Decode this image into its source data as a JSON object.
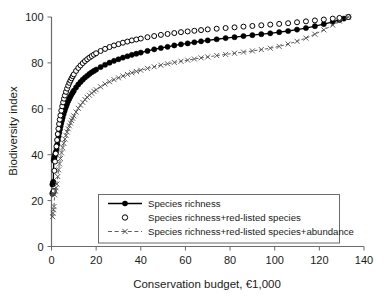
{
  "chart_data": {
    "type": "scatter",
    "title": "",
    "xlabel": "Conservation budget, €1,000",
    "ylabel": "Biodiversity index",
    "xlim": [
      0,
      140
    ],
    "ylim": [
      0,
      100
    ],
    "xticks": [
      0,
      20,
      40,
      60,
      80,
      100,
      120,
      140
    ],
    "yticks": [
      0,
      20,
      40,
      60,
      80,
      100
    ],
    "grid": false,
    "legend_position": "lower-center",
    "series": [
      {
        "name": "Species richness",
        "marker": "filled-circle",
        "line": "solid",
        "color": "#000000",
        "points": [
          [
            0.4,
            27.0
          ],
          [
            0.6,
            27.6
          ],
          [
            0.8,
            28.2
          ],
          [
            1.0,
            37.5
          ],
          [
            1.2,
            38.4
          ],
          [
            1.4,
            39.2
          ],
          [
            1.6,
            40.0
          ],
          [
            1.8,
            40.7
          ],
          [
            2.0,
            41.3
          ],
          [
            2.3,
            42.6
          ],
          [
            2.6,
            44.5
          ],
          [
            2.9,
            46.3
          ],
          [
            3.2,
            48.0
          ],
          [
            3.5,
            49.6
          ],
          [
            3.8,
            51.1
          ],
          [
            4.1,
            52.5
          ],
          [
            4.4,
            53.8
          ],
          [
            4.7,
            55.0
          ],
          [
            5.0,
            56.2
          ],
          [
            5.4,
            57.6
          ],
          [
            5.8,
            58.9
          ],
          [
            6.2,
            60.1
          ],
          [
            6.6,
            61.2
          ],
          [
            7.0,
            62.2
          ],
          [
            7.5,
            63.4
          ],
          [
            8.0,
            64.4
          ],
          [
            8.5,
            65.4
          ],
          [
            9.0,
            66.3
          ],
          [
            9.5,
            67.1
          ],
          [
            10.0,
            67.9
          ],
          [
            11.0,
            69.3
          ],
          [
            12.0,
            70.6
          ],
          [
            13.0,
            71.7
          ],
          [
            14.0,
            72.7
          ],
          [
            15.0,
            73.6
          ],
          [
            16.0,
            74.4
          ],
          [
            17.0,
            75.2
          ],
          [
            18.0,
            75.9
          ],
          [
            19.0,
            76.5
          ],
          [
            20.0,
            77.1
          ],
          [
            22.0,
            78.2
          ],
          [
            24.0,
            79.2
          ],
          [
            26.0,
            80.1
          ],
          [
            28.0,
            80.9
          ],
          [
            30.0,
            81.6
          ],
          [
            32.0,
            82.3
          ],
          [
            34.0,
            82.9
          ],
          [
            36.0,
            83.5
          ],
          [
            38.0,
            84.0
          ],
          [
            40.0,
            84.5
          ],
          [
            43.0,
            85.2
          ],
          [
            46.0,
            85.9
          ],
          [
            49.0,
            86.5
          ],
          [
            52.0,
            87.0
          ],
          [
            55.0,
            87.6
          ],
          [
            58.0,
            88.1
          ],
          [
            61.0,
            88.5
          ],
          [
            64.0,
            89.0
          ],
          [
            67.0,
            89.4
          ],
          [
            70.0,
            89.8
          ],
          [
            74.0,
            90.3
          ],
          [
            78.0,
            90.8
          ],
          [
            82.0,
            91.2
          ],
          [
            86.0,
            91.7
          ],
          [
            90.0,
            92.1
          ],
          [
            94.0,
            92.5
          ],
          [
            98.0,
            92.9
          ],
          [
            102.0,
            93.4
          ],
          [
            106.0,
            93.9
          ],
          [
            110.0,
            94.5
          ],
          [
            114.0,
            95.2
          ],
          [
            118.0,
            96.0
          ],
          [
            122.0,
            96.9
          ],
          [
            126.0,
            97.9
          ],
          [
            129.0,
            98.7
          ],
          [
            131.0,
            99.3
          ],
          [
            133.0,
            100.0
          ]
        ]
      },
      {
        "name": "Species richness+red-listed species",
        "marker": "open-circle",
        "line": "none",
        "color": "#000000",
        "points": [
          [
            0.4,
            23.0
          ],
          [
            0.6,
            23.4
          ],
          [
            0.8,
            23.8
          ],
          [
            1.0,
            24.2
          ],
          [
            1.3,
            33.0
          ],
          [
            1.6,
            37.0
          ],
          [
            1.9,
            40.5
          ],
          [
            2.2,
            43.6
          ],
          [
            2.5,
            46.4
          ],
          [
            2.8,
            49.0
          ],
          [
            3.1,
            51.3
          ],
          [
            3.4,
            53.4
          ],
          [
            3.7,
            55.3
          ],
          [
            4.0,
            57.1
          ],
          [
            4.4,
            59.2
          ],
          [
            4.8,
            61.1
          ],
          [
            5.2,
            62.8
          ],
          [
            5.6,
            64.4
          ],
          [
            6.0,
            65.8
          ],
          [
            6.5,
            67.4
          ],
          [
            7.0,
            68.8
          ],
          [
            7.5,
            70.1
          ],
          [
            8.0,
            71.3
          ],
          [
            8.5,
            72.3
          ],
          [
            9.0,
            73.3
          ],
          [
            9.5,
            74.2
          ],
          [
            10.0,
            75.0
          ],
          [
            11.0,
            76.5
          ],
          [
            12.0,
            77.8
          ],
          [
            13.0,
            78.9
          ],
          [
            14.0,
            79.9
          ],
          [
            15.0,
            80.8
          ],
          [
            16.0,
            81.6
          ],
          [
            17.0,
            82.3
          ],
          [
            18.0,
            83.0
          ],
          [
            19.0,
            83.6
          ],
          [
            20.0,
            84.2
          ],
          [
            22.0,
            85.2
          ],
          [
            24.0,
            86.1
          ],
          [
            26.0,
            86.9
          ],
          [
            28.0,
            87.6
          ],
          [
            30.0,
            88.2
          ],
          [
            32.0,
            88.8
          ],
          [
            34.0,
            89.3
          ],
          [
            36.0,
            89.8
          ],
          [
            38.0,
            90.2
          ],
          [
            40.0,
            90.6
          ],
          [
            43.0,
            91.2
          ],
          [
            46.0,
            91.7
          ],
          [
            49.0,
            92.2
          ],
          [
            52.0,
            92.6
          ],
          [
            55.0,
            93.0
          ],
          [
            58.0,
            93.4
          ],
          [
            61.0,
            93.7
          ],
          [
            64.0,
            94.0
          ],
          [
            67.0,
            94.3
          ],
          [
            70.0,
            94.6
          ],
          [
            74.0,
            94.9
          ],
          [
            78.0,
            95.2
          ],
          [
            82.0,
            95.5
          ],
          [
            86.0,
            95.8
          ],
          [
            90.0,
            96.1
          ],
          [
            94.0,
            96.4
          ],
          [
            98.0,
            96.7
          ],
          [
            102.0,
            97.0
          ],
          [
            106.0,
            97.3
          ],
          [
            110.0,
            97.7
          ],
          [
            114.0,
            98.1
          ],
          [
            118.0,
            98.5
          ],
          [
            122.0,
            98.9
          ],
          [
            126.0,
            99.3
          ],
          [
            129.0,
            99.6
          ],
          [
            133.0,
            100.0
          ]
        ]
      },
      {
        "name": "Species richness+red-listed species+abundance",
        "marker": "cross",
        "line": "dashed",
        "color": "#4d4d4d",
        "points": [
          [
            0.5,
            13.0
          ],
          [
            0.7,
            14.5
          ],
          [
            0.9,
            16.0
          ],
          [
            1.1,
            17.4
          ],
          [
            1.4,
            22.5
          ],
          [
            1.7,
            24.2
          ],
          [
            2.0,
            25.6
          ],
          [
            2.4,
            27.2
          ],
          [
            2.8,
            30.5
          ],
          [
            3.2,
            33.4
          ],
          [
            3.6,
            36.0
          ],
          [
            4.0,
            38.3
          ],
          [
            4.5,
            40.8
          ],
          [
            5.0,
            43.0
          ],
          [
            5.5,
            45.0
          ],
          [
            6.0,
            46.8
          ],
          [
            6.5,
            48.4
          ],
          [
            7.0,
            49.9
          ],
          [
            7.5,
            51.3
          ],
          [
            8.0,
            52.6
          ],
          [
            8.5,
            53.8
          ],
          [
            9.0,
            54.9
          ],
          [
            9.5,
            55.9
          ],
          [
            10.0,
            56.9
          ],
          [
            11.0,
            58.6
          ],
          [
            12.0,
            60.2
          ],
          [
            13.0,
            61.6
          ],
          [
            14.0,
            62.8
          ],
          [
            15.0,
            64.0
          ],
          [
            16.0,
            65.0
          ],
          [
            17.0,
            65.9
          ],
          [
            18.0,
            66.8
          ],
          [
            19.0,
            67.6
          ],
          [
            20.0,
            68.3
          ],
          [
            22.0,
            69.6
          ],
          [
            24.0,
            70.8
          ],
          [
            26.0,
            71.8
          ],
          [
            28.0,
            72.7
          ],
          [
            30.0,
            73.5
          ],
          [
            32.0,
            74.3
          ],
          [
            34.0,
            75.0
          ],
          [
            36.0,
            75.7
          ],
          [
            38.0,
            76.3
          ],
          [
            40.0,
            76.8
          ],
          [
            43.0,
            77.6
          ],
          [
            46.0,
            78.3
          ],
          [
            49.0,
            79.0
          ],
          [
            52.0,
            79.6
          ],
          [
            55.0,
            80.2
          ],
          [
            58.0,
            80.7
          ],
          [
            61.0,
            81.2
          ],
          [
            64.0,
            81.7
          ],
          [
            67.0,
            82.2
          ],
          [
            70.0,
            82.6
          ],
          [
            74.0,
            83.2
          ],
          [
            78.0,
            83.7
          ],
          [
            82.0,
            84.2
          ],
          [
            86.0,
            84.7
          ],
          [
            90.0,
            85.2
          ],
          [
            94.0,
            85.8
          ],
          [
            98.0,
            86.4
          ],
          [
            102.0,
            87.2
          ],
          [
            106.0,
            88.2
          ],
          [
            110.0,
            89.4
          ],
          [
            114.0,
            90.8
          ],
          [
            118.0,
            92.5
          ],
          [
            122.0,
            94.4
          ],
          [
            126.0,
            96.5
          ],
          [
            129.0,
            98.2
          ],
          [
            133.0,
            100.0
          ]
        ]
      }
    ]
  },
  "legend": {
    "items": [
      {
        "label": "Species richness"
      },
      {
        "label": "Species richness+red-listed species"
      },
      {
        "label": "Species richness+red-listed species+abundance"
      }
    ]
  }
}
